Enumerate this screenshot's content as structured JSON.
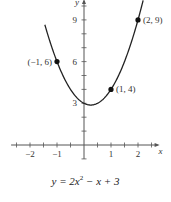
{
  "chart_data": {
    "type": "line",
    "title": "",
    "caption": "y = 2x² − x + 3",
    "equation": "y = 2x^2 - x + 3",
    "xlabel": "x",
    "ylabel": "y",
    "xlim": [
      -2.7,
      2.8
    ],
    "ylim": [
      -1,
      10.5
    ],
    "x_ticks": [
      -2,
      -1,
      1,
      2
    ],
    "x_tick_labels": [
      "−2",
      "−1",
      "1",
      "2"
    ],
    "x_minor_step": 0.5,
    "y_ticks": [
      3,
      6,
      9
    ],
    "y_tick_labels": [
      "3",
      "6",
      "9"
    ],
    "y_minor_step": 1,
    "grid": false,
    "legend": null,
    "series": [
      {
        "name": "y = 2x^2 - x + 3",
        "function": "2*x*x - x + 3",
        "x_range": [
          -1.45,
          2.2
        ],
        "color": "#222222"
      }
    ],
    "points": [
      {
        "x": -1,
        "y": 6,
        "label": "(−1, 6)",
        "label_side": "left"
      },
      {
        "x": 1,
        "y": 4,
        "label": "(1, 4)",
        "label_side": "right"
      },
      {
        "x": 2,
        "y": 9,
        "label": "(2, 9)",
        "label_side": "right"
      }
    ],
    "vertex": {
      "x": 0.25,
      "y": 2.875
    }
  },
  "axis_labels": {
    "x": "x",
    "y": "y"
  },
  "caption": {
    "prefix": "y = 2x",
    "exp": "2",
    "suffix": " − x + 3"
  }
}
